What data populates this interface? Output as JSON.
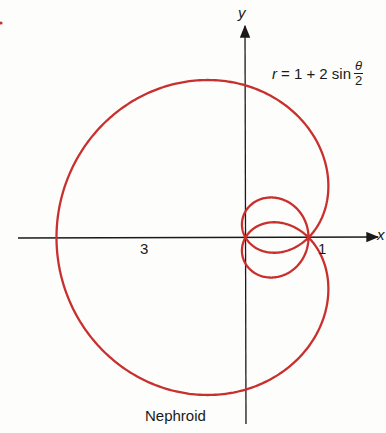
{
  "chart_data": {
    "type": "line",
    "subtype": "polar",
    "title": "Nephroid",
    "equation": "r = 1 + 2 sin θ/2",
    "equation_parts": {
      "lhs": "r",
      "rhs": "= 1 + 2 sin",
      "frac_num": "θ",
      "frac_den": "2"
    },
    "theta_range": [
      0,
      12.566370614
    ],
    "xlabel": "x",
    "ylabel": "y",
    "tick_labels": [
      {
        "value": 1,
        "label": "1"
      },
      {
        "value": -3,
        "label": "3"
      }
    ],
    "curve_color": "#c8302e",
    "axis_color": "#1a1a1a",
    "grid": false
  },
  "labels": {
    "y_axis": "y",
    "x_axis": "x",
    "tick_1": "1",
    "tick_3": "3",
    "caption": "Nephroid",
    "eq_lhs": "r",
    "eq_rhs": "= 1 + 2 sin",
    "eq_num": "θ",
    "eq_den": "2"
  }
}
